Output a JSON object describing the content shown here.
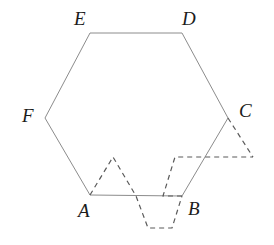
{
  "figure": {
    "canvas": {
      "width": 274,
      "height": 245
    },
    "background_color": "#ffffff",
    "solid_stroke_color": "#8c8c8c",
    "solid_stroke_width": 1,
    "dashed_stroke_color": "#5a5a5a",
    "dashed_stroke_width": 1.2,
    "dash_pattern": "5,4",
    "label_color": "#1b1b1b",
    "hexagon": {
      "name": "ABCDEF",
      "points": "90,195 182,196 228,118 182,33 90,33 45,118",
      "vertices": [
        {
          "id": "A",
          "x": 90,
          "y": 195
        },
        {
          "id": "B",
          "x": 182,
          "y": 196
        },
        {
          "id": "C",
          "x": 228,
          "y": 118
        },
        {
          "id": "D",
          "x": 182,
          "y": 33
        },
        {
          "id": "E",
          "x": 90,
          "y": 33
        },
        {
          "id": "F",
          "x": 45,
          "y": 118
        }
      ]
    },
    "dashed_paths": [
      {
        "id": "left-triangle-zigzag",
        "description": "zigzag from A up to apex then down across below AB",
        "d": "M 90,195 L 113,157 L 136,196 L 148,228 L 172,228 L 182,196"
      },
      {
        "id": "right-parallelogram",
        "description": "parallelogram from B up to horizontal dashed line",
        "d": "M 182,196 L 163,196 L 175,157 L 253,157"
      },
      {
        "id": "c-triangle",
        "description": "triangle hanging from vertex C to the dashed horizontal",
        "d": "M 228,118 L 253,157"
      }
    ],
    "labels": [
      {
        "id": "A",
        "text": "A",
        "x": 78,
        "y": 201
      },
      {
        "id": "B",
        "text": "B",
        "x": 188,
        "y": 199
      },
      {
        "id": "C",
        "text": "C",
        "x": 239,
        "y": 101
      },
      {
        "id": "D",
        "text": "D",
        "x": 182,
        "y": 9
      },
      {
        "id": "E",
        "text": "E",
        "x": 74,
        "y": 9
      },
      {
        "id": "F",
        "text": "F",
        "x": 22,
        "y": 106
      }
    ]
  }
}
